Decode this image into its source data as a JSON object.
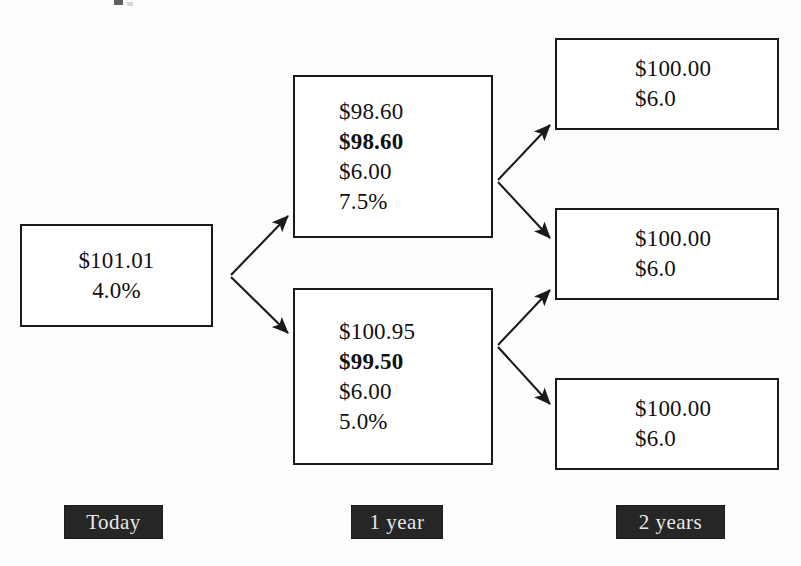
{
  "diagram": {
    "type": "binomial-interest-rate-tree",
    "nodes": [
      {
        "id": "root",
        "period": "Today",
        "lines": [
          {
            "text": "$101.01",
            "bold": false
          },
          {
            "text": "4.0%",
            "bold": false
          }
        ]
      },
      {
        "id": "up",
        "period": "1 year",
        "lines": [
          {
            "text": "$98.60",
            "bold": false
          },
          {
            "text": "$98.60",
            "bold": true
          },
          {
            "text": "$6.00",
            "bold": false
          },
          {
            "text": "7.5%",
            "bold": false
          }
        ]
      },
      {
        "id": "down",
        "period": "1 year",
        "lines": [
          {
            "text": "$100.95",
            "bold": false
          },
          {
            "text": "$99.50",
            "bold": true
          },
          {
            "text": "$6.00",
            "bold": false
          },
          {
            "text": "5.0%",
            "bold": false
          }
        ]
      },
      {
        "id": "uu",
        "period": "2 years",
        "lines": [
          {
            "text": "$100.00",
            "bold": false
          },
          {
            "text": "$6.0",
            "bold": false
          }
        ]
      },
      {
        "id": "ud",
        "period": "2 years",
        "lines": [
          {
            "text": "$100.00",
            "bold": false
          },
          {
            "text": "$6.0",
            "bold": false
          }
        ]
      },
      {
        "id": "dd",
        "period": "2 years",
        "lines": [
          {
            "text": "$100.00",
            "bold": false
          },
          {
            "text": "$6.0",
            "bold": false
          }
        ]
      }
    ],
    "edges": [
      {
        "from": "root",
        "to": "up",
        "direction": "up"
      },
      {
        "from": "root",
        "to": "down",
        "direction": "down"
      },
      {
        "from": "up",
        "to": "uu",
        "direction": "up"
      },
      {
        "from": "up",
        "to": "ud",
        "direction": "down"
      },
      {
        "from": "down",
        "to": "ud",
        "direction": "up"
      },
      {
        "from": "down",
        "to": "dd",
        "direction": "down"
      }
    ],
    "period_labels": [
      {
        "id": "today",
        "text": "Today"
      },
      {
        "id": "1year",
        "text": "1 year"
      },
      {
        "id": "2years",
        "text": "2 years"
      }
    ],
    "colors": {
      "background": "#fdfdfd",
      "box_border": "#1a1a1a",
      "box_fill": "#ffffff",
      "text": "#111111",
      "edge": "#1a1a1a",
      "label_background": "#262626",
      "label_text": "#e8e8e8"
    }
  }
}
